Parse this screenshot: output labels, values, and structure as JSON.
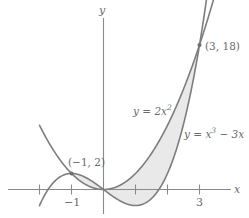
{
  "figure": {
    "axis_x_label": "x",
    "axis_y_label": "y"
  },
  "labels": {
    "parabola": "y = 2x",
    "parabola_exp": "2",
    "cubic": "y = x",
    "cubic_exp": "3",
    "cubic_tail": " − 3x",
    "point_left": "(−1, 2)",
    "point_right": "(3, 18)",
    "tick_neg_one": "−1",
    "tick_three": "3"
  },
  "colors": {
    "curve": "#7d7d7d",
    "axis": "#8a8a8a",
    "shading": "#e9e9e9",
    "text": "#6b6b6b",
    "background": "#ffffff"
  },
  "chart_data": {
    "type": "line",
    "title": "",
    "xlabel": "x",
    "ylabel": "y",
    "xlim": [
      -2.0,
      4.2
    ],
    "ylim": [
      -4.0,
      21.0
    ],
    "grid": false,
    "legend": "inline-curve-labels",
    "xticks": [
      -2,
      -1,
      1,
      2,
      3
    ],
    "xtick_labels": [
      "",
      "−1",
      "",
      "",
      "3"
    ],
    "yticks": [],
    "ytick_labels": [],
    "series": [
      {
        "name": "y = 2x^2",
        "equation": "y = 2x^2",
        "x": [
          -2.0,
          -1.75,
          -1.5,
          -1.25,
          -1.0,
          -0.75,
          -0.5,
          -0.25,
          0.0,
          0.25,
          0.5,
          0.75,
          1.0,
          1.25,
          1.5,
          1.75,
          2.0,
          2.25,
          2.5,
          2.75,
          3.0,
          3.2
        ],
        "values": [
          8.0,
          6.125,
          4.5,
          3.125,
          2.0,
          1.125,
          0.5,
          0.125,
          0.0,
          0.125,
          0.5,
          1.125,
          2.0,
          3.125,
          4.5,
          6.125,
          8.0,
          10.125,
          12.5,
          15.125,
          18.0,
          20.48
        ]
      },
      {
        "name": "y = x^3 - 3x",
        "equation": "y = x^3 - 3x",
        "x": [
          -2.0,
          -1.75,
          -1.5,
          -1.25,
          -1.0,
          -0.75,
          -0.5,
          -0.25,
          0.0,
          0.25,
          0.5,
          0.75,
          1.0,
          1.25,
          1.5,
          1.75,
          2.0,
          2.25,
          2.5,
          2.75,
          3.0,
          3.2
        ],
        "values": [
          -2.0,
          0.1719,
          1.125,
          1.7969,
          2.0,
          1.8281,
          1.375,
          0.7344,
          0.0,
          -0.7344,
          -1.375,
          -1.8281,
          -2.0,
          -1.7969,
          -1.125,
          0.1719,
          2.0,
          4.6406,
          8.125,
          12.5469,
          18.0,
          23.18
        ]
      }
    ],
    "shaded_region": {
      "label": "area between curves",
      "x_from": -1,
      "x_to": 3,
      "upper": "y = 2x^2",
      "lower": "y = x^3 - 3x",
      "fill": "#e9e9e9"
    },
    "annotations": [
      {
        "text": "(−1, 2)",
        "x": -1,
        "y": 2
      },
      {
        "text": "(3, 18)",
        "x": 3,
        "y": 18
      },
      {
        "text": "y = 2x^2",
        "x": 1.1,
        "y": 9.5
      },
      {
        "text": "y = x^3 − 3x",
        "x": 2.6,
        "y": 7.0
      }
    ],
    "intersections": [
      {
        "x": -1,
        "y": 2
      },
      {
        "x": 0,
        "y": 0
      },
      {
        "x": 3,
        "y": 18
      }
    ]
  }
}
